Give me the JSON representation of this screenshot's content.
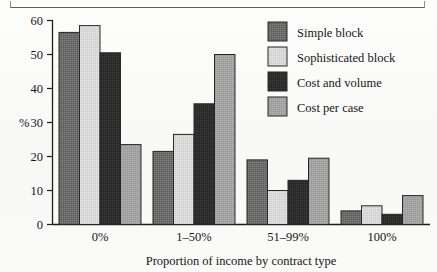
{
  "figure": {
    "axis_label_y": "%",
    "axis_title_x": "Proportion of income by contract type"
  },
  "legend": {
    "items": [
      {
        "label": "Simple block",
        "color": "#6b6b6b",
        "swatch_name": "legend-swatch-simple-block"
      },
      {
        "label": "Sophisticated block",
        "color": "#d8d8d8",
        "swatch_name": "legend-swatch-sophisticated-block"
      },
      {
        "label": "Cost and volume",
        "color": "#2e2e2e",
        "swatch_name": "legend-swatch-cost-and-volume"
      },
      {
        "label": "Cost per case",
        "color": "#a3a3a3",
        "swatch_name": "legend-swatch-cost-per-case"
      }
    ]
  },
  "axis": {
    "y_ticks": [
      "0",
      "10",
      "20",
      "30",
      "40",
      "50",
      "60"
    ],
    "x_ticks": [
      "0%",
      "1–50%",
      "51–99%",
      "100%"
    ]
  },
  "chart_data": {
    "type": "bar",
    "title": "",
    "subtitle": "",
    "xlabel": "Proportion of income by contract type",
    "ylabel": "%",
    "ylim": [
      0,
      60
    ],
    "ytick_step": 10,
    "grid": false,
    "legend_position": "top-right",
    "categories": [
      "0%",
      "1–50%",
      "51–99%",
      "100%"
    ],
    "series": [
      {
        "name": "Simple block",
        "color": "#6b6b6b",
        "values": [
          56.5,
          21.5,
          19.0,
          4.0
        ]
      },
      {
        "name": "Sophisticated block",
        "color": "#d8d8d8",
        "values": [
          58.5,
          26.5,
          10.0,
          5.5
        ]
      },
      {
        "name": "Cost and volume",
        "color": "#2e2e2e",
        "values": [
          50.5,
          35.5,
          13.0,
          3.0
        ]
      },
      {
        "name": "Cost per case",
        "color": "#a3a3a3",
        "values": [
          23.5,
          50.0,
          19.5,
          8.5
        ]
      }
    ]
  }
}
